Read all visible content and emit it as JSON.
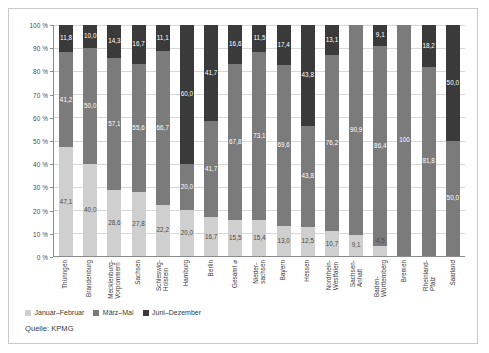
{
  "figure": {
    "source_note": "Quelle: KPMG"
  },
  "legend": {
    "items": [
      {
        "label": "Januar–Februar",
        "color": "#cfcfcf"
      },
      {
        "label": "März–Mai",
        "color": "#7b7b7b"
      },
      {
        "label": "Juni–Dezember",
        "color": "#3a3a3a"
      }
    ]
  },
  "yaxis": {
    "ticks": [
      "100 %",
      "90 %",
      "80 %",
      "70 %",
      "60 %",
      "50 %",
      "40 %",
      "30 %",
      "20 %",
      "10 %",
      "0 %"
    ]
  },
  "chart_data": {
    "type": "bar",
    "stacked": true,
    "normalized_percent": true,
    "title": "",
    "subtitle": "",
    "xlabel": "",
    "ylabel": "",
    "ylim": [
      0,
      100
    ],
    "ytick_values": [
      0,
      10,
      20,
      30,
      40,
      50,
      60,
      70,
      80,
      90,
      100
    ],
    "ytick_labels": [
      "0 %",
      "10 %",
      "20 %",
      "30 %",
      "40 %",
      "50 %",
      "60 %",
      "70 %",
      "80 %",
      "90 %",
      "100 %"
    ],
    "grid": true,
    "legend_position": "bottom-left",
    "categories": [
      "Thüringen",
      "Brandenburg",
      "Mecklenburg-\nVorpommern",
      "Sachsen",
      "Schleswig-\nHolstein",
      "Hamburg",
      "Berlin",
      "Gesamt ⌀",
      "Nieder-\nsachsen",
      "Bayern",
      "Hessen",
      "Nordrhein-\nWestfalen",
      "Sachsen-\nAnhalt",
      "Baden-\nWürttemberg",
      "Bremen",
      "Rheinland-\nPfalz",
      "Saarland"
    ],
    "series": [
      {
        "name": "Januar–Februar",
        "color": "#cfcfcf",
        "values": [
          47.1,
          40.0,
          28.6,
          27.8,
          22.2,
          20.0,
          16.7,
          15.5,
          15.4,
          13.0,
          12.5,
          10.7,
          9.1,
          4.5,
          0,
          0,
          0
        ],
        "labels": [
          "47,1",
          "40,0",
          "28,6",
          "27,8",
          "22,2",
          "20,0",
          "16,7",
          "15,5",
          "15,4",
          "13,0",
          "12,5",
          "10,7",
          "9,1",
          "4,5",
          "",
          "",
          ""
        ]
      },
      {
        "name": "März–Mai",
        "color": "#7b7b7b",
        "values": [
          41.2,
          50.0,
          57.1,
          55.6,
          66.7,
          20.0,
          41.7,
          67.8,
          73.1,
          69.6,
          43.8,
          76.2,
          90.9,
          86.4,
          100,
          81.8,
          50.0
        ],
        "labels": [
          "41,2",
          "50,0",
          "57,1",
          "55,6",
          "66,7",
          "20,0",
          "41,7",
          "67,8",
          "73,1",
          "69,6",
          "43,8",
          "76,2",
          "90,9",
          "86,4",
          "100",
          "81,8",
          "50,0"
        ]
      },
      {
        "name": "Juni–Dezember",
        "color": "#3a3a3a",
        "values": [
          11.8,
          10.0,
          14.3,
          16.7,
          11.1,
          60.0,
          41.7,
          16.6,
          11.5,
          17.4,
          43.8,
          13.1,
          0,
          9.1,
          0,
          18.2,
          50.0
        ],
        "labels": [
          "11,8",
          "10,0",
          "14,3",
          "16,7",
          "11,1",
          "60,0",
          "41,7",
          "16,6",
          "11,5",
          "17,4",
          "43,8",
          "13,1",
          "",
          "9,1",
          "",
          "18,2",
          "50,0"
        ]
      }
    ]
  }
}
